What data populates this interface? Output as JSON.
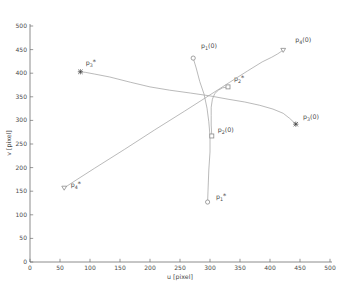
{
  "figure": {
    "width": 351,
    "height": 293,
    "background": "#ffffff"
  },
  "colors": {
    "curve": "#a8a8a8",
    "marker_outline": "#8a8a8a",
    "asterisk_marker": "#3f3f3f",
    "text": "#4a4a4a",
    "axis": "#6e6e6e"
  },
  "chart_data": {
    "type": "line",
    "title": "",
    "xlabel": "u [pixel]",
    "ylabel": "v [pixel]",
    "xlim": [
      0,
      500
    ],
    "ylim": [
      0,
      500
    ],
    "grid": false,
    "legend": "none",
    "xticks": [
      0,
      50,
      100,
      150,
      200,
      250,
      300,
      350,
      400,
      450,
      500
    ],
    "yticks": [
      0,
      50,
      100,
      150,
      200,
      250,
      300,
      350,
      400,
      450,
      500
    ],
    "series": [
      {
        "id": "p1",
        "marker": "circle",
        "points": [
          [
            272,
            432
          ],
          [
            277,
            411
          ],
          [
            283,
            382
          ],
          [
            290,
            356
          ],
          [
            295,
            326
          ],
          [
            298,
            297
          ],
          [
            300,
            267
          ],
          [
            300,
            233
          ],
          [
            298,
            195
          ],
          [
            297,
            161
          ],
          [
            296,
            127
          ]
        ],
        "start_point": [
          272,
          432
        ],
        "end_point": [
          296,
          127
        ],
        "labels": [
          {
            "base": "p",
            "sub": "1",
            "suffix": "(0)",
            "u": 285,
            "v": 453
          },
          {
            "base": "p",
            "sub": "1",
            "suffix": "*",
            "u": 310,
            "v": 133
          }
        ]
      },
      {
        "id": "p2",
        "marker": "square",
        "points": [
          [
            303,
            267
          ],
          [
            302,
            290
          ],
          [
            302,
            310
          ],
          [
            302,
            328
          ],
          [
            304,
            345
          ],
          [
            308,
            357
          ],
          [
            314,
            364
          ],
          [
            321,
            369
          ],
          [
            330,
            371
          ]
        ],
        "start_point": [
          303,
          267
        ],
        "end_point": [
          330,
          371
        ],
        "labels": [
          {
            "base": "p",
            "sub": "2",
            "suffix": "(0)",
            "u": 313,
            "v": 275
          },
          {
            "base": "p",
            "sub": "2",
            "suffix": "*",
            "u": 340,
            "v": 383
          }
        ]
      },
      {
        "id": "p3",
        "marker": "asterisk",
        "points": [
          [
            443,
            292
          ],
          [
            433,
            304
          ],
          [
            422,
            315
          ],
          [
            405,
            324
          ],
          [
            383,
            332
          ],
          [
            358,
            339
          ],
          [
            330,
            345
          ],
          [
            300,
            352
          ],
          [
            267,
            358
          ],
          [
            233,
            364
          ],
          [
            200,
            371
          ],
          [
            167,
            381
          ],
          [
            133,
            392
          ],
          [
            108,
            398
          ],
          [
            92,
            402
          ],
          [
            84,
            403
          ]
        ],
        "start_point": [
          443,
          292
        ],
        "end_point": [
          84,
          403
        ],
        "labels": [
          {
            "base": "p",
            "sub": "3",
            "suffix": "(0)",
            "u": 455,
            "v": 303
          },
          {
            "base": "p",
            "sub": "3",
            "suffix": "*",
            "u": 93,
            "v": 417
          }
        ]
      },
      {
        "id": "p4",
        "marker": "triangle-down",
        "points": [
          [
            422,
            449
          ],
          [
            413,
            441
          ],
          [
            403,
            434
          ],
          [
            387,
            424
          ],
          [
            363,
            405
          ],
          [
            333,
            381
          ],
          [
            300,
            354
          ],
          [
            258,
            320
          ],
          [
            208,
            280
          ],
          [
            158,
            239
          ],
          [
            108,
            199
          ],
          [
            75,
            172
          ],
          [
            57,
            157
          ]
        ],
        "start_point": [
          422,
          449
        ],
        "end_point": [
          57,
          157
        ],
        "labels": [
          {
            "base": "p",
            "sub": "4",
            "suffix": "(0)",
            "u": 442,
            "v": 466
          },
          {
            "base": "p",
            "sub": "4",
            "suffix": "*",
            "u": 68,
            "v": 159
          }
        ]
      }
    ]
  }
}
